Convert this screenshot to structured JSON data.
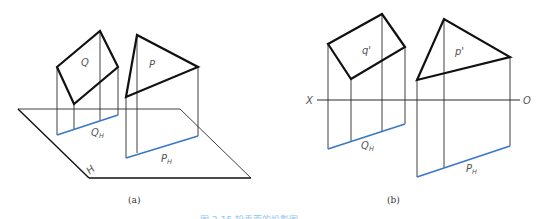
{
  "colors": {
    "outline": "#111111",
    "projector": "#2a2a2a",
    "trace": "#3a78c9",
    "caption": "#8ec3ea"
  },
  "figure_a": {
    "label": "(a)",
    "plane_q_label": "Q",
    "plane_p_label": "P",
    "trace_q_label": "Q",
    "trace_q_sub": "H",
    "trace_p_label": "P",
    "trace_p_sub": "H",
    "h_plane_label": "H"
  },
  "figure_b": {
    "label": "(b)",
    "plane_q_label": "q'",
    "plane_p_label": "p'",
    "axis_left": "X",
    "axis_right": "O",
    "trace_q_label": "Q",
    "trace_q_sub": "H",
    "trace_p_label": "P",
    "trace_p_sub": "H"
  },
  "caption": "图 3-15  铅垂面的投影图"
}
